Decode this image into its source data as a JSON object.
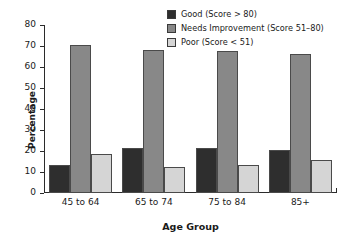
{
  "chart_data": {
    "type": "bar",
    "title": "",
    "xlabel": "Age Group",
    "ylabel": "Percentage",
    "categories": [
      "45 to 64",
      "65 to 74",
      "75 to 84",
      "85+"
    ],
    "series": [
      {
        "name": "Good (Score > 80)",
        "color": "#2e2e2e",
        "values": [
          13.5,
          21.5,
          21.5,
          20.5
        ]
      },
      {
        "name": "Needs Improvement (Score 51–80)",
        "color": "#888888",
        "values": [
          70.5,
          68.0,
          67.5,
          66.0
        ]
      },
      {
        "name": "Poor (Score < 51)",
        "color": "#d5d5d5",
        "values": [
          18.5,
          12.5,
          13.5,
          15.5
        ]
      }
    ],
    "ylim": [
      0,
      80
    ],
    "yticks": [
      0,
      10,
      20,
      30,
      40,
      50,
      60,
      70,
      80
    ],
    "ytick_labels": [
      "0",
      "10",
      "20",
      "30",
      "40",
      "50",
      "60",
      "70",
      "80"
    ],
    "grid": false,
    "legend_position": "top-right"
  },
  "legend": {
    "items": [
      {
        "label": "Good (Score > 80)",
        "color": "#2e2e2e"
      },
      {
        "label": "Needs Improvement (Score 51–80)",
        "color": "#888888"
      },
      {
        "label": "Poor (Score < 51)",
        "color": "#d5d5d5"
      }
    ]
  }
}
